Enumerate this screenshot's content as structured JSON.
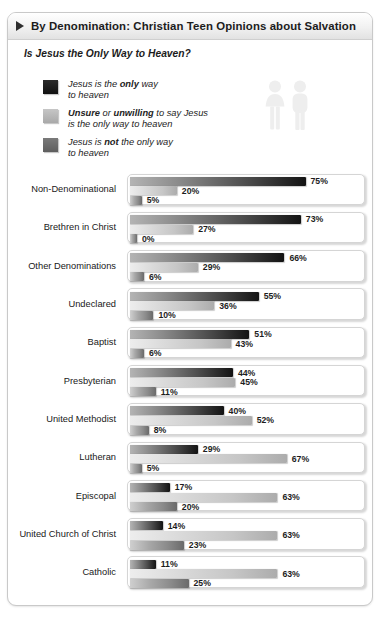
{
  "header": {
    "bullet_icon": "triangle-right-icon",
    "title": "By Denomination: Christian Teen Opinions about Salvation",
    "subtitle": "Is Jesus the Only Way to Heaven?"
  },
  "decoration": {
    "people_icon": "two-people-icon"
  },
  "legend": {
    "items": [
      {
        "color": "#131313",
        "line1_pre": "Jesus is the ",
        "line1_bold": "only",
        "line1_post": " way",
        "line2": "to heaven"
      },
      {
        "color": "#c6c6c6",
        "line1_pre": "",
        "line1_bold": "Unsure",
        "line1_mid": " or ",
        "line1_bold2": "unwilling",
        "line1_post": " to say Jesus",
        "line2": "is the only way to heaven"
      },
      {
        "color": "#6a6a6a",
        "line1_pre": "Jesus is ",
        "line1_bold": "not",
        "line1_post": " the only way",
        "line2": "to heaven"
      }
    ]
  },
  "chart_data": {
    "type": "bar",
    "title": "By Denomination: Christian Teen Opinions about Salvation",
    "subtitle": "Is Jesus the Only Way to Heaven?",
    "orientation": "horizontal",
    "grid": false,
    "legend_position": "top-left",
    "xlabel": "",
    "ylabel": "",
    "xlim": [
      0,
      100
    ],
    "unit": "%",
    "categories": [
      "Non-Denominational",
      "Brethren in Christ",
      "Other Denominations",
      "Undeclared",
      "Baptist",
      "Presbyterian",
      "United Methodist",
      "Lutheran",
      "Episcopal",
      "United Church of Christ",
      "Catholic"
    ],
    "series": [
      {
        "name": "Jesus is the only way to heaven",
        "color": "#131313",
        "values": [
          75,
          73,
          66,
          55,
          51,
          44,
          40,
          29,
          17,
          14,
          11
        ],
        "labels": [
          "75%",
          "73%",
          "66%",
          "55%",
          "51%",
          "44%",
          "40%",
          "29%",
          "17%",
          "14%",
          "11%"
        ]
      },
      {
        "name": "Unsure or unwilling to say Jesus is the only way to heaven",
        "color": "#c6c6c6",
        "values": [
          20,
          27,
          29,
          36,
          43,
          45,
          52,
          67,
          63,
          63,
          63
        ],
        "labels": [
          "20%",
          "27%",
          "29%",
          "36%",
          "43%",
          "45%",
          "52%",
          "67%",
          "63%",
          "63%",
          "63%"
        ]
      },
      {
        "name": "Jesus is not the only way to heaven",
        "color": "#6a6a6a",
        "values": [
          5,
          0,
          6,
          10,
          6,
          11,
          8,
          5,
          20,
          23,
          25
        ],
        "labels": [
          "5%",
          "0%",
          "6%",
          "10%",
          "6%",
          "11%",
          "8%",
          "5%",
          "20%",
          "23%",
          "25%"
        ]
      }
    ]
  }
}
